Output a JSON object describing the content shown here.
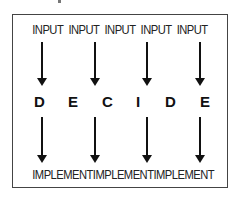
{
  "diagram": {
    "inputs": [
      "INPUT",
      "INPUT",
      "INPUT",
      "INPUT",
      "INPUT"
    ],
    "decide_letters": [
      "D",
      "E",
      "C",
      "I",
      "D",
      "E"
    ],
    "implements": [
      "IMPLEMENT",
      "IMPLEMENT",
      "IMPLEMENT"
    ],
    "colors": {
      "text": "#222222",
      "border": "#444444",
      "background": "#ffffff"
    }
  }
}
